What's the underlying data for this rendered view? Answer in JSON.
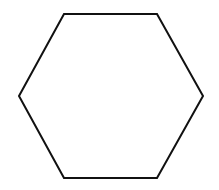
{
  "canvas": {
    "width": 219,
    "height": 190,
    "background": "#ffffff"
  },
  "shape": {
    "type": "hexagon",
    "points": "64,14 157,14 203,96 157,178 64,178 19,96",
    "stroke": "#111111",
    "stroke_width": 2,
    "fill": "none"
  }
}
